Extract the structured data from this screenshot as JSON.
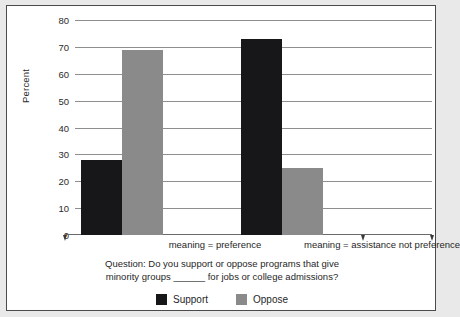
{
  "chart_data": {
    "type": "bar",
    "title": "",
    "xlabel": "",
    "ylabel": "Percent",
    "ylim": [
      0,
      80
    ],
    "yticks": [
      0,
      10,
      20,
      30,
      40,
      50,
      60,
      70,
      80
    ],
    "grid": true,
    "legend_position": "bottom",
    "categories": [
      "meaning = preference",
      "meaning = assistance not preference"
    ],
    "series": [
      {
        "name": "Support",
        "color": "#17171a",
        "values": [
          28,
          73
        ]
      },
      {
        "name": "Oppose",
        "color": "#8a8a8a",
        "values": [
          69,
          25
        ]
      }
    ],
    "annotations": {
      "question_line_1": "Question: Do you support or oppose programs that give",
      "question_line_2": "minority groups ______ for jobs or college admissions?"
    }
  },
  "legend": {
    "items": [
      {
        "label": "Support",
        "color": "#17171a"
      },
      {
        "label": "Oppose",
        "color": "#8a8a8a"
      }
    ]
  },
  "colors": {
    "background": "#ffffff",
    "page_background": "#e9e9e9",
    "frame": "#4b4b4b",
    "gridline": "#8e8e8e",
    "text": "#1f1f1f",
    "support": "#17171a",
    "oppose": "#8a8a8a"
  }
}
